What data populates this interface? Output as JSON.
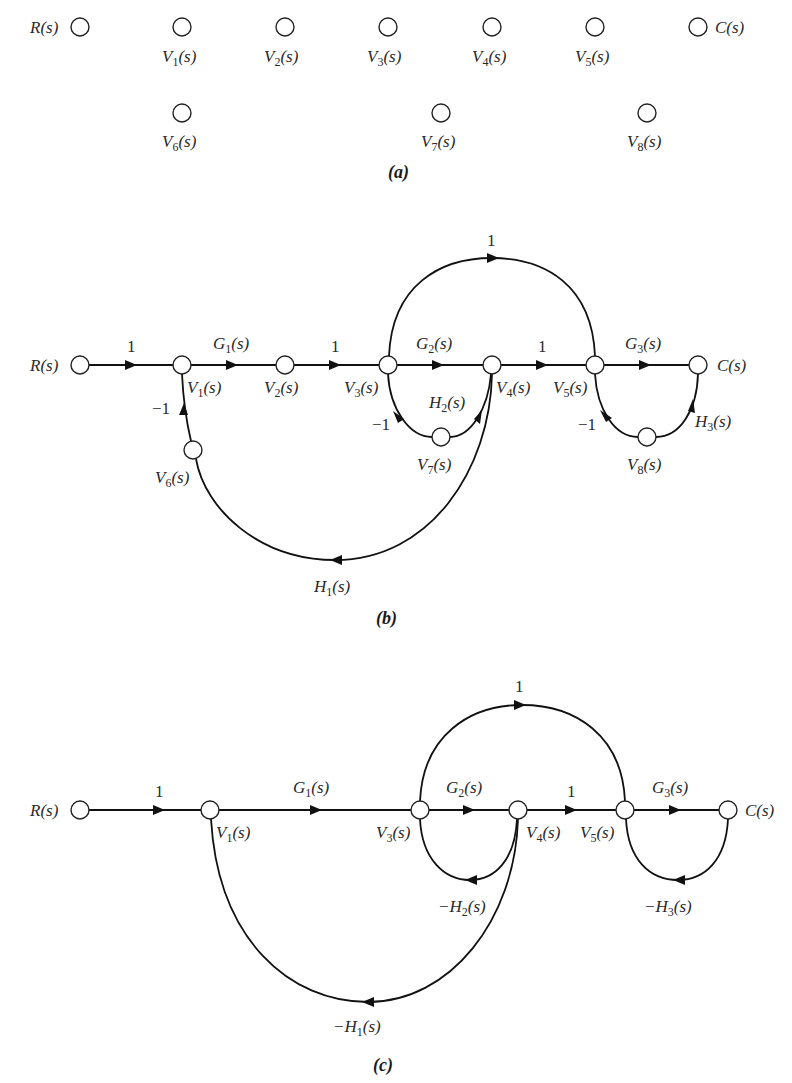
{
  "figure": {
    "panels": [
      {
        "id": "a",
        "caption": "(a)",
        "nodes": [
          {
            "id": "R",
            "label": "R(s)"
          },
          {
            "id": "V1",
            "label": "V1(s)"
          },
          {
            "id": "V2",
            "label": "V2(s)"
          },
          {
            "id": "V3",
            "label": "V3(s)"
          },
          {
            "id": "V4",
            "label": "V4(s)"
          },
          {
            "id": "V5",
            "label": "V5(s)"
          },
          {
            "id": "C",
            "label": "C(s)"
          },
          {
            "id": "V6",
            "label": "V6(s)"
          },
          {
            "id": "V7",
            "label": "V7(s)"
          },
          {
            "id": "V8",
            "label": "V8(s)"
          }
        ],
        "edges": []
      },
      {
        "id": "b",
        "caption": "(b)",
        "nodes": [
          {
            "id": "R",
            "label": "R(s)"
          },
          {
            "id": "V1",
            "label": "V1(s)"
          },
          {
            "id": "V2",
            "label": "V2(s)"
          },
          {
            "id": "V3",
            "label": "V3(s)"
          },
          {
            "id": "V4",
            "label": "V4(s)"
          },
          {
            "id": "V5",
            "label": "V5(s)"
          },
          {
            "id": "C",
            "label": "C(s)"
          },
          {
            "id": "V6",
            "label": "V6(s)"
          },
          {
            "id": "V7",
            "label": "V7(s)"
          },
          {
            "id": "V8",
            "label": "V8(s)"
          }
        ],
        "edges": [
          {
            "from": "R",
            "to": "V1",
            "gain": "1"
          },
          {
            "from": "V1",
            "to": "V2",
            "gain": "G1(s)"
          },
          {
            "from": "V2",
            "to": "V3",
            "gain": "1"
          },
          {
            "from": "V3",
            "to": "V4",
            "gain": "G2(s)"
          },
          {
            "from": "V4",
            "to": "V5",
            "gain": "1"
          },
          {
            "from": "V5",
            "to": "C",
            "gain": "G3(s)"
          },
          {
            "from": "V3",
            "to": "V5",
            "gain": "1"
          },
          {
            "from": "V4",
            "to": "V7",
            "gain": "H2(s)"
          },
          {
            "from": "V7",
            "to": "V3",
            "gain": "-1"
          },
          {
            "from": "C",
            "to": "V8",
            "gain": "H3(s)"
          },
          {
            "from": "V8",
            "to": "V5",
            "gain": "-1"
          },
          {
            "from": "V4",
            "to": "V6",
            "gain": "H1(s)"
          },
          {
            "from": "V6",
            "to": "V1",
            "gain": "-1"
          }
        ]
      },
      {
        "id": "c",
        "caption": "(c)",
        "nodes": [
          {
            "id": "R",
            "label": "R(s)"
          },
          {
            "id": "V1",
            "label": "V1(s)"
          },
          {
            "id": "V3",
            "label": "V3(s)"
          },
          {
            "id": "V4",
            "label": "V4(s)"
          },
          {
            "id": "V5",
            "label": "V5(s)"
          },
          {
            "id": "C",
            "label": "C(s)"
          }
        ],
        "edges": [
          {
            "from": "R",
            "to": "V1",
            "gain": "1"
          },
          {
            "from": "V1",
            "to": "V3",
            "gain": "G1(s)"
          },
          {
            "from": "V3",
            "to": "V4",
            "gain": "G2(s)"
          },
          {
            "from": "V4",
            "to": "V5",
            "gain": "1"
          },
          {
            "from": "V5",
            "to": "C",
            "gain": "G3(s)"
          },
          {
            "from": "V3",
            "to": "V5",
            "gain": "1"
          },
          {
            "from": "V4",
            "to": "V3",
            "gain": "-H2(s)"
          },
          {
            "from": "C",
            "to": "V5",
            "gain": "-H3(s)"
          },
          {
            "from": "V4",
            "to": "V1",
            "gain": "-H1(s)"
          }
        ]
      }
    ]
  },
  "labels": {
    "R": "R(s)",
    "C": "C(s)",
    "V1_base": "V",
    "V1_sub": "1",
    "V2_sub": "2",
    "V3_sub": "3",
    "V4_sub": "4",
    "V5_sub": "5",
    "V6_sub": "6",
    "V7_sub": "7",
    "V8_sub": "8",
    "s_suffix": "(s)",
    "G": "G",
    "H": "H",
    "neg_H": "−H",
    "one": "1",
    "minus_one": "−1",
    "cap_a": "(a)",
    "cap_b": "(b)",
    "cap_c": "(c)"
  }
}
